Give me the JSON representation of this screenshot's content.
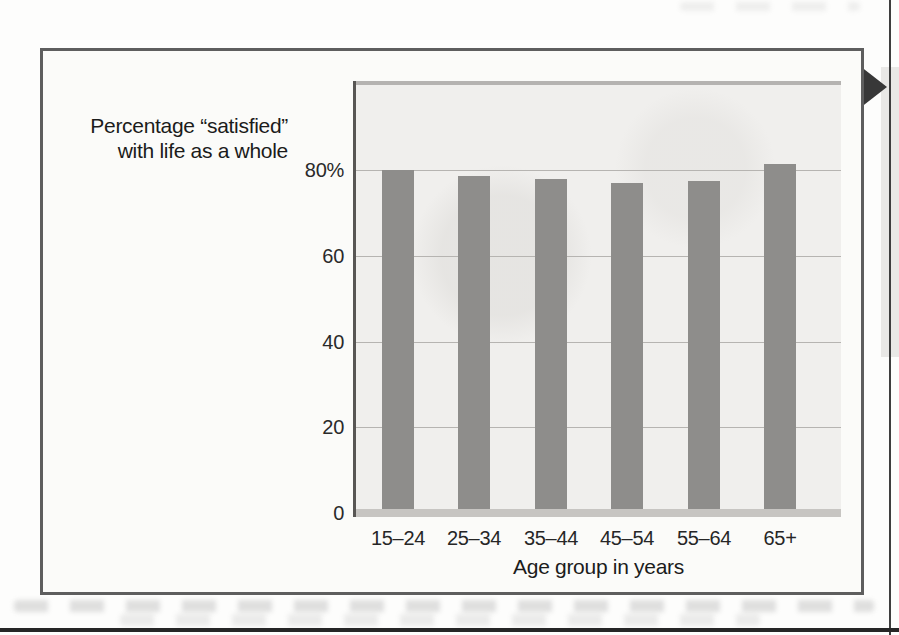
{
  "figure": {
    "label_line1": "Percentage “satisfied”",
    "label_line2": "with life as a whole"
  },
  "chart_data": {
    "type": "bar",
    "title": "Percentage “satisfied” with life as a whole",
    "categories": [
      "15–24",
      "25–34",
      "35–44",
      "45–54",
      "55–64",
      "65+"
    ],
    "values": [
      80,
      78.5,
      78,
      77,
      77.5,
      81.5
    ],
    "xlabel": "Age group in years",
    "ylabel": "Percentage “satisfied” with life as a whole",
    "ylim": [
      0,
      100
    ],
    "yticks": [
      0,
      20,
      40,
      60,
      80
    ],
    "ytick_labels": [
      "0",
      "20",
      "40",
      "60",
      "80%"
    ],
    "grid": true,
    "legend": null,
    "bar_color": "#8e8d8b",
    "plot_bg": "#f0efed"
  },
  "page": {
    "marker": "right-pointing section arrow",
    "arrow_color": "#383838",
    "accent_grays": {
      "figure_border": "#5e5e5e",
      "bottom_rule": "#262626",
      "page_edge_line": "#3e3e3e",
      "margin_strip": "#e9e8e6"
    }
  }
}
